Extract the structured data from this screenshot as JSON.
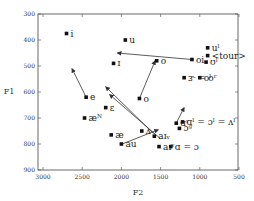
{
  "chart_data": {
    "type": "scatter",
    "title": "",
    "xlabel": "F2",
    "ylabel": "F1",
    "xlim": [
      3000,
      500
    ],
    "ylim": [
      900,
      300
    ],
    "x_reversed": true,
    "y_reversed": true,
    "xticks": [
      3000,
      2500,
      2000,
      1500,
      1000,
      500
    ],
    "yticks": [
      300,
      400,
      500,
      600,
      700,
      800,
      900
    ],
    "grid": false,
    "points": [
      {
        "label": "i",
        "F2": 2700,
        "F1": 375
      },
      {
        "label": "u",
        "F2": 1950,
        "F1": 400
      },
      {
        "label": "uˡ",
        "F2": 900,
        "F1": 430
      },
      {
        "label": "<tour>",
        "F2": 900,
        "F1": 460
      },
      {
        "label": "ʊˡ",
        "F2": 920,
        "F1": 485
      },
      {
        "label": "oi",
        "F2": 1100,
        "F1": 475
      },
      {
        "label": "ɪ",
        "F2": 2100,
        "F1": 490
      },
      {
        "label": "o",
        "F2": 1550,
        "F1": 480
      },
      {
        "label": "oˡ",
        "F2": 1000,
        "F1": 545
      },
      {
        "label": "ɝ = oʳ",
        "F2": 1200,
        "F1": 545
      },
      {
        "label": "o",
        "F2": 1770,
        "F1": 625
      },
      {
        "label": "e",
        "F2": 2450,
        "F1": 620
      },
      {
        "label": "ɛ",
        "F2": 2200,
        "F1": 660
      },
      {
        "label": "æᴺ",
        "F2": 2470,
        "F1": 700
      },
      {
        "label": "æ",
        "F2": 2130,
        "F1": 765
      },
      {
        "label": "ɑʳ",
        "F2": 1300,
        "F1": 720
      },
      {
        "label": "ɑˡ = ɔˡ = ʌˡ",
        "F2": 1220,
        "F1": 715
      },
      {
        "label": "ʌ",
        "F2": 1740,
        "F1": 750
      },
      {
        "label": "aɪᵥ",
        "F2": 1580,
        "F1": 770
      },
      {
        "label": "au",
        "F2": 2000,
        "F1": 800
      },
      {
        "label": "aɪᵛ",
        "F2": 1520,
        "F1": 810
      },
      {
        "label": "ɑ = ɔ",
        "F2": 1370,
        "F1": 810
      },
      {
        "label": "ɔᵍ",
        "F2": 1260,
        "F1": 740
      }
    ],
    "arrows": [
      {
        "from": [
          1100,
          475
        ],
        "to": [
          2050,
          450
        ]
      },
      {
        "from": [
          1770,
          625
        ],
        "to": [
          1570,
          480
        ]
      },
      {
        "from": [
          2450,
          620
        ],
        "to": [
          2630,
          510
        ]
      },
      {
        "from": [
          1590,
          760
        ],
        "to": [
          2200,
          580
        ]
      },
      {
        "from": [
          1500,
          780
        ],
        "to": [
          2150,
          610
        ]
      },
      {
        "from": [
          1990,
          800
        ],
        "to": [
          1530,
          745
        ]
      },
      {
        "from": [
          1300,
          720
        ],
        "to": [
          1200,
          660
        ]
      }
    ]
  }
}
